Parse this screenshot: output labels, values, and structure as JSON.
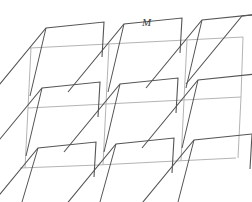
{
  "figure": {
    "type": "geometric-lattice-diagram",
    "title": "",
    "width": 252,
    "height": 202,
    "background_color": "#ffffff",
    "label": {
      "text": "M",
      "x": 142,
      "y": 26,
      "style": "italic",
      "color": "#3c3c3c"
    },
    "grid": {
      "name": "unit-cell-lattice",
      "color": "#b4b4b4",
      "stroke_width": 1.0,
      "rows": 2,
      "cols": 3,
      "description": "Light gray parallelogram lattice of unit cells",
      "lines": [
        {
          "name": "grid-row-top",
          "points": "30,48 108,44 186,40 243,37"
        },
        {
          "name": "grid-row-middle",
          "points": "28,108 106,104 184,100 241,97"
        },
        {
          "name": "grid-row-bottom",
          "points": "20,168 98,165 176,161 236,158"
        },
        {
          "name": "grid-col-left",
          "points": "31,48 28,108 25,168"
        },
        {
          "name": "grid-col-two",
          "points": "109,44 106,104 103,165"
        },
        {
          "name": "grid-col-three",
          "points": "187,40 184,100 181,161"
        },
        {
          "name": "grid-col-right",
          "points": "243,37 241,97 238,158"
        }
      ]
    },
    "motifs": {
      "name": "zigzag-motif-set",
      "color": "#555555",
      "stroke_width": 1.1,
      "count": 9,
      "description": "Repeating dark zigzag motif: steep rising stroke, long diagonal to an apex, then a near-vertical drop",
      "paths": [
        {
          "name": "motif-row0-col0",
          "points": "-10,96 46,28 104,22 102,57"
        },
        {
          "name": "motif-row0-col1",
          "points": "68,92 124,24 182,18 180,53"
        },
        {
          "name": "motif-row0-col2",
          "points": "146,88 202,20 260,14 258,49"
        },
        {
          "name": "motif-row0-col3",
          "points": "186,84 242,16 252,15"
        },
        {
          "name": "motif-row1-col0",
          "points": "-14,156 42,88 100,82 98,117"
        },
        {
          "name": "motif-row1-col1",
          "points": "64,152 120,84 178,78 176,113"
        },
        {
          "name": "motif-row1-col2",
          "points": "142,148 198,80 256,74 254,109"
        },
        {
          "name": "motif-row2-col0",
          "points": "-18,216 38,148 96,142 94,177"
        },
        {
          "name": "motif-row2-col1",
          "points": "60,212 116,144 174,138 172,173"
        },
        {
          "name": "motif-row2-col2",
          "points": "138,208 194,140 252,134 250,169"
        }
      ]
    },
    "secondary_motifs": {
      "name": "secondary-stroke-set",
      "color": "#555555",
      "stroke_width": 1.0,
      "description": "Steep near-vertical strokes crossing the cells, forming the interlocking tile edges",
      "paths": [
        {
          "name": "steep-stroke-a0",
          "points": "46,28 30,96"
        },
        {
          "name": "steep-stroke-a1",
          "points": "124,24 108,92"
        },
        {
          "name": "steep-stroke-a2",
          "points": "202,20 186,88"
        },
        {
          "name": "steep-stroke-b0",
          "points": "42,88 26,156"
        },
        {
          "name": "steep-stroke-b1",
          "points": "120,84 104,152"
        },
        {
          "name": "steep-stroke-b2",
          "points": "198,80 182,148"
        },
        {
          "name": "steep-stroke-c0",
          "points": "38,148 22,202"
        },
        {
          "name": "steep-stroke-c1",
          "points": "116,144 100,202"
        },
        {
          "name": "steep-stroke-c2",
          "points": "194,140 178,202"
        }
      ]
    }
  }
}
